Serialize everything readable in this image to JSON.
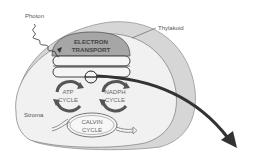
{
  "diagram": {
    "labels": {
      "photon": "Photon",
      "thylakoid": "Thylakoid",
      "stroma": "Stroma",
      "electron_transport_line1": "ELECTRON",
      "electron_transport_line2": "TRANSPORT",
      "atp_line1": "ATP",
      "atp_line2": "CYCLE",
      "nadph_line1": "NADPH",
      "nadph_line2": "CYCLE",
      "calvin_line1": "CALVIN",
      "calvin_line2": "CYCLE"
    },
    "colors": {
      "outer_membrane": "#d4d4d4",
      "stroma_fill": "#f0f0f0",
      "electron_transport_fill": "#a8a8a8",
      "thylakoid_disc": "#f4f4f4",
      "cycle_arrow": "#555555",
      "big_arrow": "#333333",
      "outline": "#777777"
    }
  }
}
